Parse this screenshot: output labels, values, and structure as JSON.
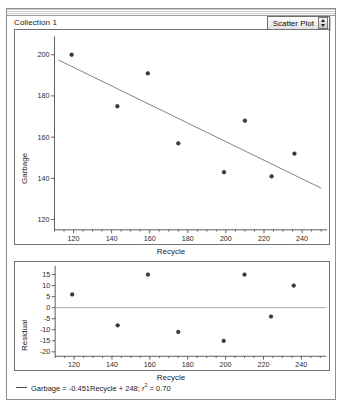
{
  "window": {
    "collection_label": "Collection 1",
    "plot_type_menu": {
      "label": "Scatter Plot",
      "stepper_icon": "up-down-stepper-icon"
    }
  },
  "legend": {
    "marker_icon": "line-dash-icon",
    "equation": "Garbage = -0.451Recycle + 248; r",
    "exponent": "2",
    "r_squared_tail": " = 0.70"
  },
  "chart_data": [
    {
      "type": "scatter",
      "title": "",
      "xlabel": "Recycle",
      "ylabel": "Garbage",
      "xlim": [
        110,
        250
      ],
      "ylim": [
        115,
        208
      ],
      "xticks": [
        120,
        140,
        160,
        180,
        200,
        220,
        240
      ],
      "yticks": [
        120,
        140,
        160,
        180,
        200
      ],
      "grid": false,
      "legend_position": "bottom",
      "points": [
        {
          "x": 119,
          "y": 200
        },
        {
          "x": 143,
          "y": 175
        },
        {
          "x": 159,
          "y": 191
        },
        {
          "x": 175,
          "y": 157
        },
        {
          "x": 199,
          "y": 143
        },
        {
          "x": 210,
          "y": 168
        },
        {
          "x": 224,
          "y": 141
        },
        {
          "x": 236,
          "y": 152
        }
      ],
      "fit_line": {
        "label": "Garbage = -0.451Recycle + 248",
        "slope": -0.451,
        "intercept": 248,
        "r_squared": 0.7
      }
    },
    {
      "type": "scatter",
      "title": "",
      "xlabel": "Recycle",
      "ylabel": "Residual",
      "xlim": [
        110,
        250
      ],
      "ylim": [
        -22,
        18
      ],
      "xticks": [
        120,
        140,
        160,
        180,
        200,
        220,
        240
      ],
      "yticks": [
        15,
        10,
        5,
        0,
        -5,
        -10,
        -15,
        -20
      ],
      "grid": false,
      "reference_line": 0,
      "points": [
        {
          "x": 119,
          "y": 6
        },
        {
          "x": 143,
          "y": -8
        },
        {
          "x": 159,
          "y": 15
        },
        {
          "x": 175,
          "y": -11
        },
        {
          "x": 199,
          "y": -15
        },
        {
          "x": 210,
          "y": 15
        },
        {
          "x": 224,
          "y": -4
        },
        {
          "x": 236,
          "y": 10
        }
      ]
    }
  ]
}
